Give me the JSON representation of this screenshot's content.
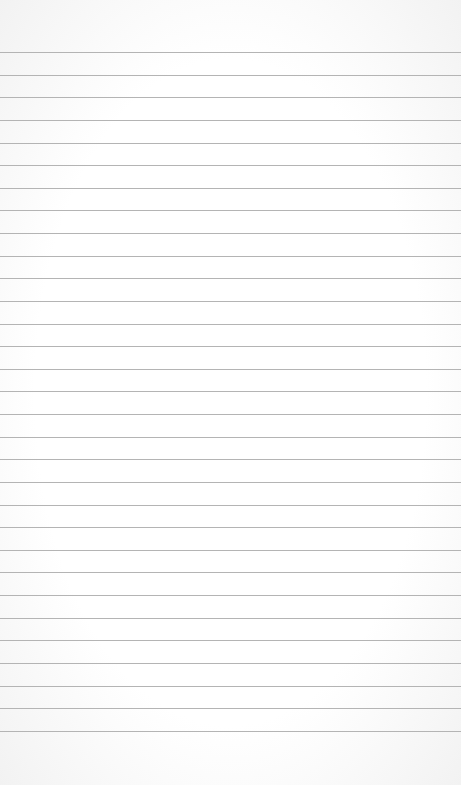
{
  "paper": {
    "type": "lined-paper",
    "background_color": "#ffffff",
    "line_color": "#b4b4b4",
    "first_line_y": 52,
    "line_spacing": 22.63,
    "line_count": 31
  }
}
